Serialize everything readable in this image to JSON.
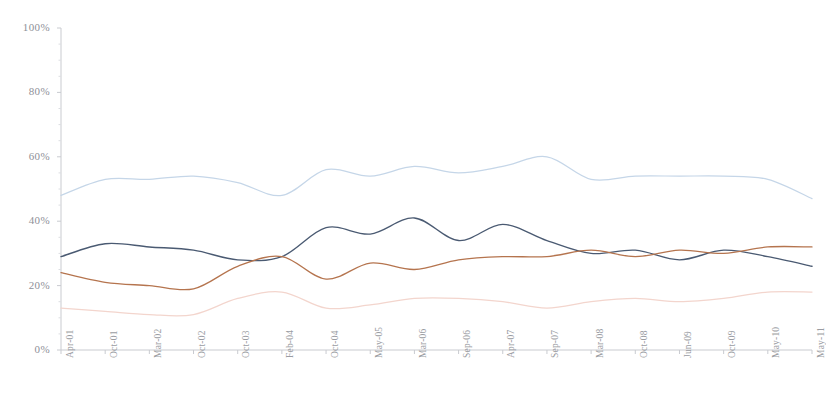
{
  "chart_data": {
    "type": "line",
    "title": "",
    "subtitle": "",
    "xlabel": "",
    "ylabel": "",
    "ylim": [
      0,
      100
    ],
    "ytick_labels": [
      "0%",
      "20%",
      "40%",
      "60%",
      "80%",
      "100%"
    ],
    "ytick_values": [
      0,
      20,
      40,
      60,
      80,
      100
    ],
    "grid": false,
    "legend": "none",
    "categories": [
      "Apr-01",
      "Oct-01",
      "Mar-02",
      "Oct-02",
      "Oct-03",
      "Feb-04",
      "Oct-04",
      "May-05",
      "Mar-06",
      "Sep-06",
      "Apr-07",
      "Sep-07",
      "Mar-08",
      "Oct-08",
      "Jun-09",
      "Oct-09",
      "May-10",
      "May-11"
    ],
    "series": [
      {
        "name": "series-1",
        "color": "#c5d6e8",
        "values": [
          48,
          53,
          53,
          54,
          52,
          48,
          56,
          54,
          57,
          55,
          57,
          60,
          53,
          54,
          54,
          54,
          53,
          47
        ]
      },
      {
        "name": "series-2",
        "color": "#4a5a72",
        "values": [
          29,
          33,
          32,
          31,
          28,
          29,
          38,
          36,
          41,
          34,
          39,
          34,
          30,
          31,
          28,
          31,
          29,
          26
        ]
      },
      {
        "name": "series-3",
        "color": "#b5744e",
        "values": [
          24,
          21,
          20,
          19,
          26,
          29,
          22,
          27,
          25,
          28,
          29,
          29,
          31,
          29,
          31,
          30,
          32,
          32
        ]
      },
      {
        "name": "series-4",
        "color": "#f3d5cd",
        "values": [
          13,
          12,
          11,
          11,
          16,
          18,
          13,
          14,
          16,
          16,
          15,
          13,
          15,
          16,
          15,
          16,
          18,
          18
        ]
      }
    ]
  },
  "axis": {
    "y_axis_name": "percentage-axis",
    "x_axis_name": "time-axis"
  }
}
